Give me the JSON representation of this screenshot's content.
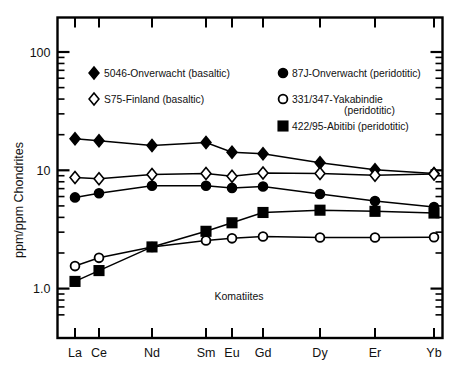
{
  "figure": {
    "annotation": "Komatiites",
    "frame_color": "#000000"
  },
  "chart_data": {
    "type": "line",
    "title": "",
    "subtitle": "",
    "annotation": "Komatiites",
    "xlabel": "",
    "ylabel": "ppm/ppm Chondrites",
    "yscale": "log",
    "ylim": [
      0.55,
      200
    ],
    "grid": false,
    "legend_position": "upper-center-inside",
    "categories": [
      "La",
      "Ce",
      "Nd",
      "Sm",
      "Eu",
      "Gd",
      "Dy",
      "Er",
      "Yb"
    ],
    "x_tick_labels": [
      "La",
      "Ce",
      "Nd",
      "Sm",
      "Eu",
      "Gd",
      "Dy",
      "Er",
      "Yb"
    ],
    "y_tick_labels": [
      "100",
      "10",
      "1.0"
    ],
    "y_tick_values": [
      100,
      10,
      1.0
    ],
    "series": [
      {
        "name": "5046-Onverwacht (basaltic)",
        "marker": "filled-diamond",
        "values": [
          18.5,
          17.8,
          16.2,
          17.2,
          14.2,
          13.8,
          11.6,
          10.1,
          9.4
        ]
      },
      {
        "name": "S75-Finland (basaltic)",
        "marker": "open-diamond",
        "values": [
          8.7,
          8.5,
          9.2,
          9.4,
          8.9,
          9.5,
          9.4,
          9.1,
          9.3
        ]
      },
      {
        "name": "87J-Onverwacht (peridotitic)",
        "marker": "filled-circle",
        "values": [
          5.9,
          6.4,
          7.4,
          7.4,
          7.1,
          7.3,
          6.3,
          5.5,
          4.9
        ]
      },
      {
        "name": "331/347-Yakabindie (peridotitic)",
        "marker": "open-circle",
        "values": [
          1.55,
          1.82,
          2.25,
          2.55,
          2.66,
          2.76,
          2.7,
          2.7,
          2.72
        ]
      },
      {
        "name": "422/95-Abitibi (peridotitic)",
        "marker": "filled-square",
        "values": [
          1.15,
          1.42,
          2.25,
          3.05,
          3.6,
          4.4,
          4.6,
          4.5,
          4.35
        ]
      }
    ]
  },
  "legend": {
    "left_column": [
      {
        "marker": "filled-diamond",
        "label": "5046-Onverwacht (basaltic)"
      },
      {
        "marker": "open-diamond",
        "label": "S75-Finland (basaltic)"
      }
    ],
    "right_column": [
      {
        "marker": "filled-circle",
        "label": "87J-Onverwacht (peridotitic)"
      },
      {
        "marker": "open-circle",
        "label": "331/347-Yakabindie",
        "label2": "(peridotitic)"
      },
      {
        "marker": "filled-square",
        "label": "422/95-Abitibi (peridotitic)"
      }
    ]
  },
  "axes": {
    "y_title": "ppm/ppm Chondrites",
    "y_labels": [
      "100",
      "10",
      "1.0"
    ],
    "x_labels": [
      "La",
      "Ce",
      "Nd",
      "Sm",
      "Eu",
      "Gd",
      "Dy",
      "Er",
      "Yb"
    ]
  }
}
